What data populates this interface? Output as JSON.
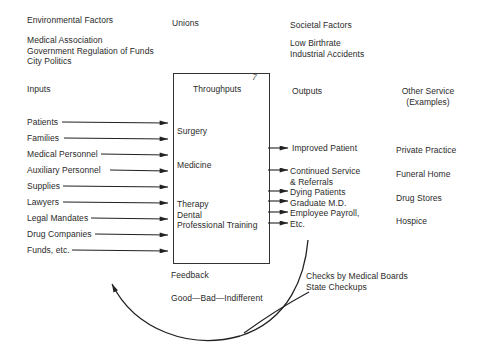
{
  "environmental": {
    "heading": "Environmental Factors",
    "items": [
      "Medical Association",
      "Government Regulation of Funds",
      "City Politics"
    ]
  },
  "unions": {
    "label": "Unions"
  },
  "societal": {
    "heading": "Societal Factors",
    "items": [
      "Low Birthrate",
      "Industrial Accidents"
    ]
  },
  "columns": {
    "inputs": "Inputs",
    "throughputs": "Throughputs",
    "outputs": "Outputs",
    "other_service_line1": "Other Service",
    "other_service_line2": "(Examples)"
  },
  "inputs": [
    "Patients",
    "Families",
    "Medical Personnel",
    "Auxiliary Personnel",
    "Supplies",
    "Lawyers",
    "Legal Mandates",
    "Drug Companies",
    "Funds, etc."
  ],
  "throughputs": {
    "surgery": "Surgery",
    "medicine": "Medicine",
    "group": [
      "Therapy",
      "Dental",
      "Professional Training"
    ]
  },
  "outputs": {
    "improved": "Improved Patient",
    "continued_1": "Continued Service",
    "continued_2": "& Referrals",
    "dying": "Dying Patients",
    "graduate": "Graduate M.D.",
    "payroll_1": "Employee Payroll,",
    "payroll_2": "Etc."
  },
  "other_services": [
    "Private Practice",
    "Funeral Home",
    "Drug Stores",
    "Hospice"
  ],
  "feedback": {
    "label": "Feedback",
    "values": "Good—Bad—Indifferent",
    "checks_1": "Checks by Medical Boards",
    "checks_2": "State Checkups"
  },
  "box_mark": "7"
}
